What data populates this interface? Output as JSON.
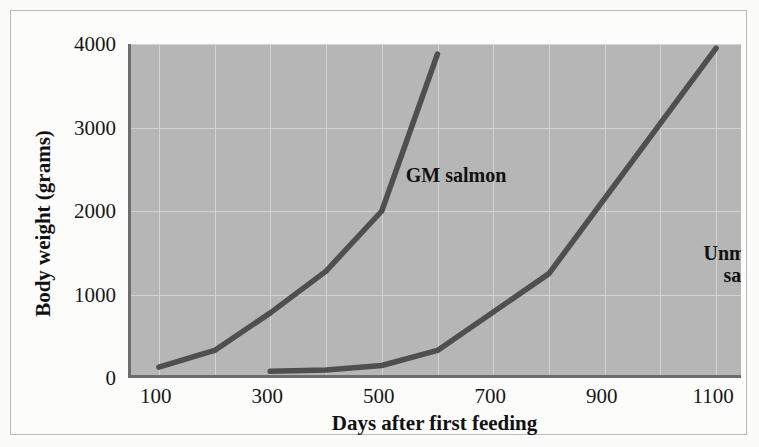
{
  "chart_data": {
    "type": "line",
    "title": "",
    "xlabel": "Days after first feeding",
    "ylabel": "Body weight (grams)",
    "xlim": [
      50,
      1150
    ],
    "ylim": [
      0,
      4000
    ],
    "xticks": [
      100,
      300,
      500,
      700,
      900,
      1100
    ],
    "xtick_labels": [
      "100",
      "300",
      "500",
      "700",
      "900",
      "1100"
    ],
    "yticks": [
      0,
      1000,
      2000,
      3000,
      4000
    ],
    "ytick_labels": [
      "0",
      "1000",
      "2000",
      "3000",
      "4000"
    ],
    "grid": true,
    "grid_x_step": 100,
    "legend_position": "inline-annotations",
    "plot_background": "#b6b6b6",
    "line_color": "#4f4f4f",
    "axis_color": "#6d6d6d",
    "series": [
      {
        "name": "GM salmon",
        "label_text": "GM salmon",
        "x": [
          100,
          200,
          300,
          400,
          500,
          600
        ],
        "values": [
          130,
          330,
          780,
          1280,
          2000,
          3880
        ]
      },
      {
        "name": "Unmodified salmon",
        "label_text": "Unmodified\nsalmon",
        "x": [
          300,
          400,
          500,
          600,
          800,
          1100
        ],
        "values": [
          80,
          95,
          150,
          330,
          1250,
          3950
        ]
      }
    ]
  }
}
